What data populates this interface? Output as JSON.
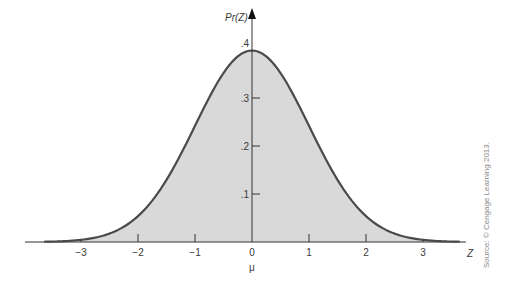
{
  "chart_data": {
    "type": "area",
    "title": "",
    "xlabel": "Z",
    "xlabel_sub": "μ",
    "ylabel": "Pr(Z)",
    "x_ticks": [
      "−3",
      "−2",
      "−1",
      "0",
      "1",
      "2",
      "3"
    ],
    "x_tick_values": [
      -3,
      -2,
      -1,
      0,
      1,
      2,
      3
    ],
    "y_ticks": [
      ".1",
      ".2",
      ".3",
      ".4"
    ],
    "y_tick_values": [
      0.1,
      0.2,
      0.3,
      0.4
    ],
    "xlim": [
      -3.7,
      3.7
    ],
    "ylim": [
      0,
      0.42
    ],
    "shaded_range": [
      -3,
      3
    ],
    "grid": false,
    "legend": null,
    "series": [
      {
        "name": "Pr(Z)",
        "x": [
          -3.5,
          -3,
          -2.5,
          -2,
          -1.5,
          -1,
          -0.5,
          0,
          0.5,
          1,
          1.5,
          2,
          2.5,
          3,
          3.5
        ],
        "values": [
          0.001,
          0.004,
          0.018,
          0.054,
          0.13,
          0.242,
          0.352,
          0.399,
          0.352,
          0.242,
          0.13,
          0.054,
          0.018,
          0.004,
          0.001
        ]
      }
    ],
    "colors": {
      "curve": "#4a4a4a",
      "fill": "#d9d9d9",
      "axis": "#333333"
    }
  },
  "labels": {
    "y_axis_title": "Pr(Z)",
    "x_axis_title": "Z",
    "mu": "μ",
    "source": "Source: © Cengage Learning 2013."
  }
}
